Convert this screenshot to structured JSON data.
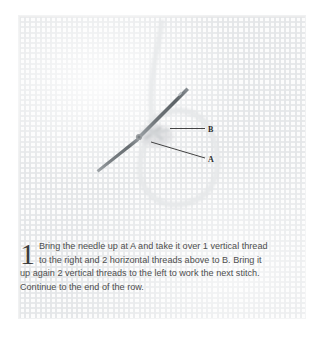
{
  "page": {
    "background_color": "#ffffff",
    "panel_color": "#fcfcfc",
    "thread_color": "#d9dbdd",
    "needle_color": "#6d7175",
    "leader_line_color": "#2e2e2e",
    "text_color": "#4e4e4e"
  },
  "illustration": {
    "title": "cross-stitch-needle-diagram",
    "subject": "needle passing through aida fabric with looping thread",
    "labels": [
      {
        "id": "B",
        "text": "B",
        "x": 212,
        "y": 130,
        "leader": "horizontal"
      },
      {
        "id": "A",
        "text": "A",
        "x": 212,
        "y": 159,
        "leader": "diagonal"
      }
    ],
    "fabric": {
      "weave": "aida-grid",
      "cell_size_px": 5.2
    }
  },
  "caption": {
    "step_number": "1",
    "line1": "Bring the needle up at A and take it over 1 vertical thread",
    "line2": "to the right and 2 horizontal threads above to B. Bring it",
    "line3": "up again 2 vertical threads to the left to work the next stitch.",
    "line4": "Continue to the end of the row.",
    "full_text": "Bring the needle up at A and take it over 1 vertical thread to the right and 2 horizontal threads above to B. Bring it up again 2 vertical threads to the left to work the next stitch. Continue to the end of the row."
  }
}
